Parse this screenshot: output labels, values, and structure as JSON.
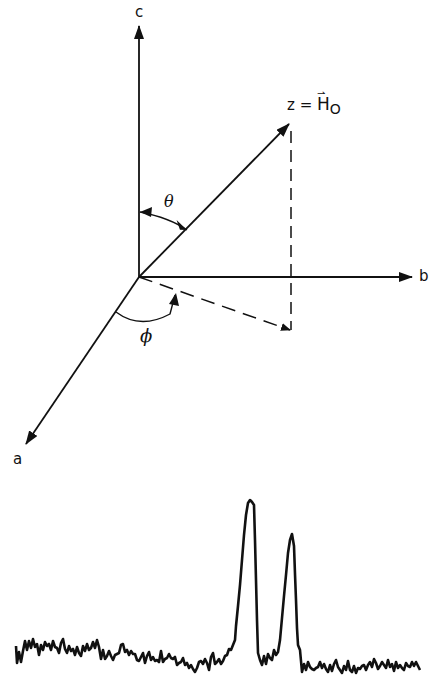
{
  "diagram": {
    "axes": {
      "a": {
        "label": "a"
      },
      "b": {
        "label": "b"
      },
      "c": {
        "label": "c"
      },
      "z": {
        "label_prefix": "z =",
        "label_vector": "H",
        "label_sub": "O"
      }
    },
    "angles": {
      "theta": {
        "label": "θ"
      },
      "phi": {
        "label": "ϕ"
      }
    },
    "colors": {
      "ink": "#111111",
      "background": "#ffffff"
    }
  },
  "spectrum": {
    "description": "Noisy baseline trace with two resonance peaks",
    "peaks": [
      {
        "name": "peak-1",
        "x_px": 251,
        "relative_height": 1.0
      },
      {
        "name": "peak-2",
        "x_px": 292,
        "relative_height": 0.78
      }
    ]
  }
}
